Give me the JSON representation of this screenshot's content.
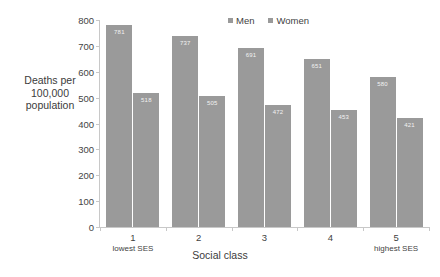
{
  "chart_data": {
    "type": "bar",
    "title": "",
    "xlabel": "Social class",
    "ylabel": "Deaths per 100,000 population",
    "categories": [
      "1",
      "2",
      "3",
      "4",
      "5"
    ],
    "category_sublabels": [
      "lowest SES",
      "",
      "",
      "",
      "highest SES"
    ],
    "series": [
      {
        "name": "Men",
        "color": "#9a9a9a",
        "values": [
          781,
          737,
          691,
          651,
          580
        ]
      },
      {
        "name": "Women",
        "color": "#9a9a9a",
        "values": [
          518,
          505,
          472,
          453,
          421
        ]
      }
    ],
    "ylim": [
      0,
      800
    ],
    "yticks": [
      800,
      700,
      600,
      500,
      400,
      300,
      200,
      100,
      0
    ],
    "grid": false,
    "legend_position": "top-center",
    "data_labels": true
  },
  "axis": {
    "y_title_lines": [
      "Deaths per",
      "100,000",
      "population"
    ],
    "x_title": "Social class",
    "tick_labels": [
      "800",
      "700",
      "600",
      "500",
      "400",
      "300",
      "200",
      "100",
      "0"
    ]
  },
  "legend": {
    "items": [
      {
        "label": "Men",
        "color": "#9a9a9a"
      },
      {
        "label": "Women",
        "color": "#9a9a9a"
      }
    ]
  },
  "bars": {
    "men": [
      {
        "category": "1",
        "value": 781,
        "label": "781"
      },
      {
        "category": "2",
        "value": 737,
        "label": "737"
      },
      {
        "category": "3",
        "value": 691,
        "label": "691"
      },
      {
        "category": "4",
        "value": 651,
        "label": "651"
      },
      {
        "category": "5",
        "value": 580,
        "label": "580"
      }
    ],
    "women": [
      {
        "category": "1",
        "value": 518,
        "label": "518"
      },
      {
        "category": "2",
        "value": 505,
        "label": "505"
      },
      {
        "category": "3",
        "value": 472,
        "label": "472"
      },
      {
        "category": "4",
        "value": 453,
        "label": "453"
      },
      {
        "category": "5",
        "value": 421,
        "label": "421"
      }
    ]
  },
  "xaxis_labels": [
    {
      "main": "1",
      "sub": "lowest SES"
    },
    {
      "main": "2",
      "sub": ""
    },
    {
      "main": "3",
      "sub": ""
    },
    {
      "main": "4",
      "sub": ""
    },
    {
      "main": "5",
      "sub": "highest SES"
    }
  ],
  "colors": {
    "men_bar": "#9a9a9a",
    "women_bar": "#9a9a9a",
    "axis": "#c8c8c8",
    "text": "#3b3b3b",
    "data_label": "#f2f2f2",
    "background": "#ffffff"
  }
}
